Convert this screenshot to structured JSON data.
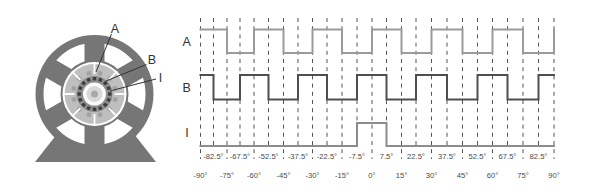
{
  "motor_diagram": {
    "callouts": [
      {
        "label": "A"
      },
      {
        "label": "B"
      },
      {
        "label": "I"
      }
    ],
    "colors": {
      "housing": "#767676",
      "stator": "#bfbfbf",
      "code_ring": "#8d8d8d",
      "teeth": "#3c3c3c",
      "hub": "#d9d9d9"
    }
  },
  "timing_diagram": {
    "signals": [
      {
        "name": "A",
        "color": "#9b9b9b",
        "segments_deg": [
          [
            -90,
            -75,
            1
          ],
          [
            -75,
            -60,
            0
          ],
          [
            -60,
            -45,
            1
          ],
          [
            -45,
            -30,
            0
          ],
          [
            -30,
            -15,
            1
          ],
          [
            -15,
            0,
            0
          ],
          [
            0,
            15,
            1
          ],
          [
            15,
            30,
            0
          ],
          [
            30,
            45,
            1
          ],
          [
            45,
            60,
            0
          ],
          [
            60,
            75,
            1
          ],
          [
            75,
            90,
            0
          ]
        ],
        "end_edge": "rise"
      },
      {
        "name": "B",
        "color": "#4e4e4e",
        "segments_deg": [
          [
            -90,
            -82.5,
            1
          ],
          [
            -82.5,
            -67.5,
            0
          ],
          [
            -67.5,
            -52.5,
            1
          ],
          [
            -52.5,
            -37.5,
            0
          ],
          [
            -37.5,
            -22.5,
            1
          ],
          [
            -22.5,
            -7.5,
            0
          ],
          [
            -7.5,
            7.5,
            1
          ],
          [
            7.5,
            22.5,
            0
          ],
          [
            22.5,
            37.5,
            1
          ],
          [
            37.5,
            52.5,
            0
          ],
          [
            52.5,
            67.5,
            1
          ],
          [
            67.5,
            82.5,
            0
          ],
          [
            82.5,
            90,
            1
          ]
        ],
        "end_edge": "none"
      },
      {
        "name": "I",
        "color": "#8c8c8c",
        "segments_deg": [
          [
            -90,
            -7.5,
            0
          ],
          [
            -7.5,
            7.5,
            1
          ],
          [
            7.5,
            90,
            0
          ]
        ],
        "end_edge": "none"
      }
    ],
    "axis": {
      "range_deg": [
        -90,
        90
      ],
      "gridline_step_deg": 7.5,
      "major_labels": [
        "-90°",
        "-75°",
        "-60°",
        "-45°",
        "-30°",
        "-15°",
        "0°",
        "15°",
        "30°",
        "45°",
        "60°",
        "75°",
        "90°"
      ],
      "minor_labels": [
        "-82.5°",
        "-67.5°",
        "-52.5°",
        "-37.5°",
        "-22.5°",
        "-7.5°",
        "7.5°",
        "22.5°",
        "37.5°",
        "52.5°",
        "67.5°",
        "82.5°"
      ]
    }
  }
}
